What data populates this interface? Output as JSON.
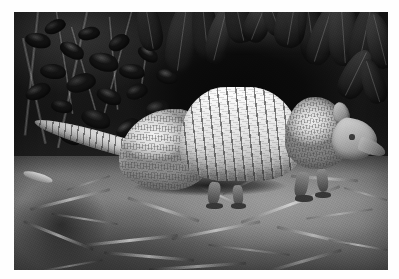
{
  "image": {
    "kind": "photograph",
    "color_mode": "grayscale",
    "caption": "Nine-banded armadillo foraging on leaf litter at night",
    "orientation": "landscape",
    "border_color": "#ffffff",
    "frame": {
      "left": 14,
      "top": 12,
      "width": 374,
      "height": 258
    }
  },
  "subject": {
    "name": "armadillo",
    "common_name": "Nine-banded armadillo",
    "facing": "right",
    "pose": "walking",
    "parts": [
      {
        "name": "rear-shield",
        "label": "Pelvic shield"
      },
      {
        "name": "banded-midsection",
        "label": "Movable bands"
      },
      {
        "name": "front-shield",
        "label": "Scapular shield"
      },
      {
        "name": "head",
        "label": "Head"
      },
      {
        "name": "ear",
        "label": "Ear"
      },
      {
        "name": "snout",
        "label": "Snout"
      },
      {
        "name": "eye",
        "label": "Eye"
      },
      {
        "name": "tail",
        "label": "Tail"
      },
      {
        "name": "legs",
        "label": "Legs"
      }
    ],
    "band_count": 9
  },
  "scene": {
    "background": "dark tropical foliage",
    "foreground": "dry grass and leaf litter",
    "lighting": "flash at night",
    "regions": [
      {
        "name": "canopy-leaves",
        "label": "Hanging leaves"
      },
      {
        "name": "bush-foliage",
        "label": "Bush foliage"
      },
      {
        "name": "ground-litter",
        "label": "Ground litter"
      }
    ]
  },
  "palette": {
    "shell_highlight": "#f5f2e9",
    "shell_midtone": "#c9c4b7",
    "shell_shadow": "#7e7a70",
    "foliage_dark": "#1d1c1a",
    "void_black": "#0a0a09",
    "ground_light": "#8a877e",
    "ground_dark": "#43413c"
  },
  "leaves": [
    {
      "left": 41.0,
      "top": -4.0,
      "w": 8.0,
      "h": 28.0,
      "rot": 8,
      "tone": "#4a4740"
    },
    {
      "left": 47.5,
      "top": -6.0,
      "w": 7.0,
      "h": 24.0,
      "rot": -6,
      "tone": "#37352f"
    },
    {
      "left": 52.0,
      "top": -2.0,
      "w": 6.2,
      "h": 22.0,
      "rot": 14,
      "tone": "#57544c"
    },
    {
      "left": 56.5,
      "top": -7.0,
      "w": 7.6,
      "h": 19.0,
      "rot": -12,
      "tone": "#403d37"
    },
    {
      "left": 62.0,
      "top": -5.0,
      "w": 6.8,
      "h": 17.0,
      "rot": 22,
      "tone": "#615d54"
    },
    {
      "left": 66.5,
      "top": -6.0,
      "w": 6.0,
      "h": 15.0,
      "rot": -20,
      "tone": "#4b4841"
    },
    {
      "left": 70.0,
      "top": -8.0,
      "w": 8.4,
      "h": 22.0,
      "rot": 10,
      "tone": "#5c584f"
    },
    {
      "left": 76.0,
      "top": -6.0,
      "w": 7.2,
      "h": 26.0,
      "rot": -8,
      "tone": "#474views"
    },
    {
      "left": 79.5,
      "top": -3.0,
      "w": 6.6,
      "h": 24.0,
      "rot": 18,
      "tone": "#524e46"
    },
    {
      "left": 84.0,
      "top": -7.0,
      "w": 8.0,
      "h": 28.0,
      "rot": -4,
      "tone": "#5f5b52"
    },
    {
      "left": 90.0,
      "top": -4.0,
      "w": 7.4,
      "h": 26.0,
      "rot": 12,
      "tone": "#4c4942"
    },
    {
      "left": 94.5,
      "top": 0.0,
      "w": 6.8,
      "h": 22.0,
      "rot": -14,
      "tone": "#575349"
    },
    {
      "left": 33.0,
      "top": -5.0,
      "w": 6.4,
      "h": 20.0,
      "rot": -10,
      "tone": "#403d36"
    },
    {
      "left": 88.0,
      "top": 14.0,
      "w": 7.0,
      "h": 20.0,
      "rot": 26,
      "tone": "#4a463f"
    },
    {
      "left": 93.0,
      "top": 18.0,
      "w": 6.0,
      "h": 18.0,
      "rot": -18,
      "tone": "#3e3b35"
    }
  ],
  "bush_leaves": [
    {
      "left": 3,
      "top": 8,
      "w": 7,
      "h": 6,
      "rot": 14,
      "tone": "#45423b"
    },
    {
      "left": 8,
      "top": 3,
      "w": 6,
      "h": 5,
      "rot": -22,
      "tone": "#3a3832"
    },
    {
      "left": 12,
      "top": 12,
      "w": 7,
      "h": 6,
      "rot": 30,
      "tone": "#514d45"
    },
    {
      "left": 17,
      "top": 6,
      "w": 6,
      "h": 5,
      "rot": -8,
      "tone": "#413e38"
    },
    {
      "left": 20,
      "top": 16,
      "w": 8,
      "h": 7,
      "rot": 18,
      "tone": "#4d4941"
    },
    {
      "left": 25,
      "top": 9,
      "w": 6,
      "h": 6,
      "rot": -26,
      "tone": "#37352f"
    },
    {
      "left": 28,
      "top": 20,
      "w": 7,
      "h": 6,
      "rot": 10,
      "tone": "#46433c"
    },
    {
      "left": 14,
      "top": 24,
      "w": 8,
      "h": 7,
      "rot": -14,
      "tone": "#3c3934"
    },
    {
      "left": 22,
      "top": 30,
      "w": 7,
      "h": 6,
      "rot": 24,
      "tone": "#4a4740"
    },
    {
      "left": 30,
      "top": 28,
      "w": 6,
      "h": 6,
      "rot": -18,
      "tone": "#403d37"
    },
    {
      "left": 7,
      "top": 20,
      "w": 7,
      "h": 6,
      "rot": 8,
      "tone": "#33312c"
    },
    {
      "left": 33,
      "top": 14,
      "w": 6,
      "h": 5,
      "rot": 34,
      "tone": "#55514a"
    },
    {
      "left": 35,
      "top": 34,
      "w": 7,
      "h": 7,
      "rot": -10,
      "tone": "#44413a"
    },
    {
      "left": 18,
      "top": 38,
      "w": 8,
      "h": 7,
      "rot": 20,
      "tone": "#3e3b35"
    },
    {
      "left": 27,
      "top": 42,
      "w": 7,
      "h": 6,
      "rot": -30,
      "tone": "#4b4740"
    },
    {
      "left": 10,
      "top": 34,
      "w": 6,
      "h": 5,
      "rot": 12,
      "tone": "#383630"
    },
    {
      "left": 3,
      "top": 28,
      "w": 7,
      "h": 6,
      "rot": -20,
      "tone": "#424039"
    },
    {
      "left": 38,
      "top": 22,
      "w": 6,
      "h": 6,
      "rot": 16,
      "tone": "#4f4b44"
    },
    {
      "left": 32,
      "top": 48,
      "w": 7,
      "h": 6,
      "rot": -6,
      "tone": "#3a3832"
    },
    {
      "left": 12,
      "top": 46,
      "w": 6,
      "h": 5,
      "rot": 28,
      "tone": "#454239"
    }
  ],
  "stems": [
    {
      "left": 6,
      "top": 0,
      "w": 1.0,
      "h": 48,
      "rot": 6
    },
    {
      "left": 11,
      "top": 0,
      "w": 0.8,
      "h": 40,
      "rot": -9
    },
    {
      "left": 19,
      "top": 0,
      "w": 1.1,
      "h": 54,
      "rot": 12
    },
    {
      "left": 25,
      "top": 2,
      "w": 0.7,
      "h": 36,
      "rot": -5
    },
    {
      "left": 31,
      "top": 0,
      "w": 0.9,
      "h": 44,
      "rot": 15
    },
    {
      "left": 2,
      "top": 10,
      "w": 1.2,
      "h": 42,
      "rot": -12
    },
    {
      "left": 36,
      "top": 4,
      "w": 0.7,
      "h": 30,
      "rot": 8
    },
    {
      "left": 15,
      "top": 6,
      "w": 0.8,
      "h": 38,
      "rot": -16
    }
  ],
  "straws": [
    {
      "left": 4,
      "top": 72,
      "w": 22,
      "h": 1.1,
      "rot": -14,
      "tone": "#cfcabd"
    },
    {
      "left": 10,
      "top": 80,
      "w": 18,
      "h": 0.9,
      "rot": 9,
      "tone": "#b3aea2"
    },
    {
      "left": 18,
      "top": 88,
      "w": 26,
      "h": 1.2,
      "rot": -6,
      "tone": "#ddd8cb"
    },
    {
      "left": 30,
      "top": 76,
      "w": 20,
      "h": 1.0,
      "rot": 18,
      "tone": "#c2bdb1"
    },
    {
      "left": 42,
      "top": 84,
      "w": 24,
      "h": 1.1,
      "rot": -11,
      "tone": "#d4cfc2"
    },
    {
      "left": 52,
      "top": 92,
      "w": 22,
      "h": 0.9,
      "rot": 7,
      "tone": "#a8a398"
    },
    {
      "left": 60,
      "top": 74,
      "w": 28,
      "h": 1.2,
      "rot": -20,
      "tone": "#e2ddd0"
    },
    {
      "left": 70,
      "top": 86,
      "w": 20,
      "h": 1.0,
      "rot": 13,
      "tone": "#c7c2b6"
    },
    {
      "left": 78,
      "top": 78,
      "w": 18,
      "h": 0.9,
      "rot": -8,
      "tone": "#b8b3a7"
    },
    {
      "left": 24,
      "top": 94,
      "w": 24,
      "h": 1.1,
      "rot": 5,
      "tone": "#cfcabd"
    },
    {
      "left": 46,
      "top": 70,
      "w": 16,
      "h": 0.8,
      "rot": 24,
      "tone": "#d9d4c7"
    },
    {
      "left": 66,
      "top": 96,
      "w": 22,
      "h": 1.0,
      "rot": -16,
      "tone": "#aeaa9f"
    },
    {
      "left": 2,
      "top": 86,
      "w": 20,
      "h": 1.0,
      "rot": 22,
      "tone": "#bdb8ac"
    },
    {
      "left": 84,
      "top": 90,
      "w": 16,
      "h": 0.9,
      "rot": 10,
      "tone": "#d2cdc0"
    },
    {
      "left": 36,
      "top": 98,
      "w": 26,
      "h": 1.1,
      "rot": -4,
      "tone": "#c5c0b4"
    },
    {
      "left": 55,
      "top": 66,
      "w": 14,
      "h": 0.8,
      "rot": -26,
      "tone": "#e6e1d4"
    },
    {
      "left": 88,
      "top": 70,
      "w": 12,
      "h": 0.9,
      "rot": 16,
      "tone": "#b5b0a4"
    },
    {
      "left": 14,
      "top": 66,
      "w": 12,
      "h": 0.8,
      "rot": -18,
      "tone": "#9e9a8f"
    },
    {
      "left": 74,
      "top": 64,
      "w": 18,
      "h": 1.0,
      "rot": 4,
      "tone": "#cbc6b9"
    },
    {
      "left": 6,
      "top": 98,
      "w": 18,
      "h": 0.9,
      "rot": -10,
      "tone": "#a5a195"
    }
  ],
  "legs": [
    {
      "left": 52.0,
      "top": 66.0,
      "w": 3.2,
      "h": 9.0,
      "rot": 6
    },
    {
      "left": 58.5,
      "top": 67.0,
      "w": 2.8,
      "h": 8.0,
      "rot": -4
    },
    {
      "left": 75.0,
      "top": 62.0,
      "w": 3.6,
      "h": 10.0,
      "rot": 10
    },
    {
      "left": 81.0,
      "top": 61.0,
      "w": 3.0,
      "h": 9.0,
      "rot": -6
    }
  ],
  "feet": [
    {
      "left": 51.4,
      "top": 74.0,
      "w": 4.4,
      "h": 2.4
    },
    {
      "left": 58.0,
      "top": 74.2,
      "w": 4.0,
      "h": 2.2
    },
    {
      "left": 75.2,
      "top": 71.0,
      "w": 4.8,
      "h": 2.6
    },
    {
      "left": 80.6,
      "top": 69.6,
      "w": 4.2,
      "h": 2.4
    }
  ]
}
